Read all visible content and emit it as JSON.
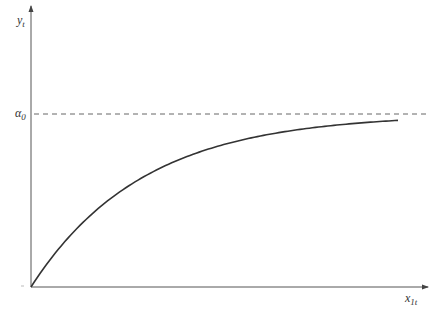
{
  "chart_data": {
    "type": "line",
    "title": "",
    "xlabel": "x_{1t}",
    "ylabel": "y_t",
    "xlabel_main": "x",
    "xlabel_sub": "1t",
    "ylabel_main": "y",
    "ylabel_sub": "t",
    "annotations": [
      {
        "text": "α_0",
        "main": "α",
        "sub": "0",
        "type": "horizontal-asymptote",
        "style": "dashed",
        "y": 1.0
      }
    ],
    "series": [
      {
        "name": "y_t = α_0 (1 - e^{-k x_1t})",
        "description": "concave increasing curve starting at origin and approaching α_0 asymptotically",
        "x": [
          0,
          0.1,
          0.2,
          0.3,
          0.4,
          0.5,
          0.6,
          0.7,
          0.8,
          0.9,
          1.0
        ],
        "values": [
          0,
          0.28,
          0.48,
          0.63,
          0.73,
          0.81,
          0.86,
          0.9,
          0.93,
          0.95,
          0.96
        ]
      }
    ],
    "xlim": [
      0,
      1.08
    ],
    "ylim": [
      0,
      1.0
    ],
    "grid": false,
    "legend": "none",
    "ticks": "none"
  },
  "colors": {
    "axis": "#555555",
    "curve": "#333333",
    "asymptote": "#666666"
  }
}
